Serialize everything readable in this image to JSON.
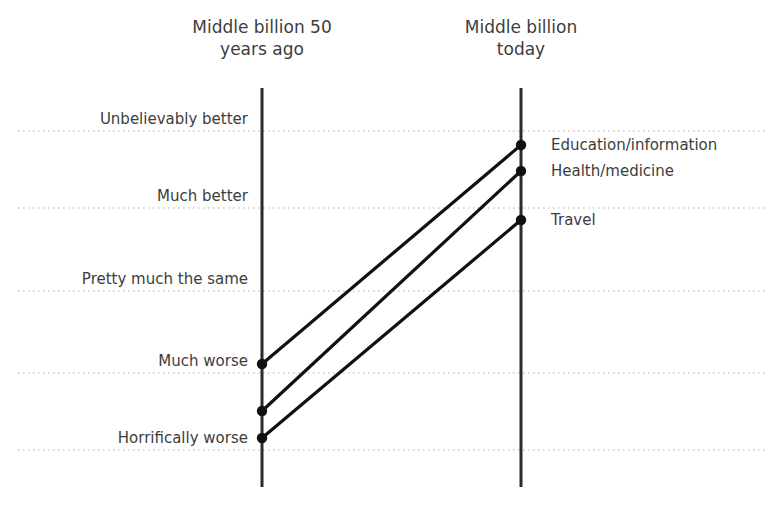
{
  "chart_data": {
    "type": "line",
    "title": "",
    "subtitle": "",
    "xlabel": "",
    "ylabel": "",
    "grid": true,
    "legend_position": "right-of-endpoints",
    "categories": [
      "Middle billion 50 years ago",
      "Middle billion today"
    ],
    "column_titles": [
      "Middle billion 50\nyears ago",
      "Middle billion\ntoday"
    ],
    "y_scale_labels": [
      "Unbelievably better",
      "Much better",
      "Pretty much the same",
      "Much worse",
      "Horrifically worse"
    ],
    "y_scale_values": [
      5,
      4,
      3,
      2,
      1
    ],
    "ylim": [
      0.6,
      5.2
    ],
    "series": [
      {
        "name": "Education/information",
        "start_label": "Much worse",
        "end_label": "Unbelievably better",
        "values": [
          1.75,
          4.82
        ]
      },
      {
        "name": "Health/medicine",
        "start_label": "Horrifically worse",
        "end_label": "Unbelievably better",
        "values": [
          1.15,
          4.48
        ]
      },
      {
        "name": "Travel",
        "start_label": "Horrifically worse",
        "end_label": "Much better",
        "values": [
          0.82,
          3.85
        ]
      }
    ]
  },
  "colors": {
    "line": "#111111",
    "marker": "#111111",
    "axis": "#2b2b2b",
    "gridline": "#c9c9c9",
    "text": "#3d3d3d",
    "background": "#ffffff"
  },
  "geometry": {
    "left_axis_x": 262,
    "right_axis_x": 521,
    "axis_top_y": 88,
    "axis_bottom_y": 487,
    "grid_left_x": 18,
    "grid_right_x": 765,
    "gridline_y": [
      131,
      208,
      291,
      373,
      450
    ],
    "left_points_y": [
      364,
      411,
      438
    ],
    "right_points_y": [
      145,
      171,
      220
    ]
  }
}
